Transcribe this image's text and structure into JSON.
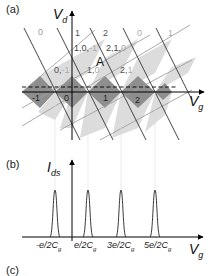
{
  "panel_a": {
    "label": "(a)",
    "y_axis_label": "V",
    "y_axis_sub": "d",
    "x_axis_label": "V",
    "x_axis_sub": "g",
    "point_label": "A",
    "top_labels": [
      "0",
      "1",
      "2",
      "0",
      "1"
    ],
    "top_label_colors": [
      "#999999",
      "#555555",
      "#555555",
      "#aaaaaa",
      "#aaaaaa"
    ],
    "row1_labels": [
      {
        "a": "1,0,",
        "b": "-1"
      },
      {
        "a": "2,1,",
        "b": "0"
      }
    ],
    "row2_labels": [
      {
        "a": "0,",
        "b": "-1"
      },
      {
        "a": "1,",
        "b": "0"
      },
      {
        "a": "2,",
        "b": "1"
      }
    ],
    "bottom_labels": [
      "-1",
      "0",
      "1",
      "2"
    ],
    "colors": {
      "dark_fill": "#8c8c8c",
      "light_fill": "#d9d9d9",
      "dark_line": "#333333",
      "gray_line": "#9a9a9a",
      "axis": "#000000"
    }
  },
  "panel_b": {
    "label": "(b)",
    "y_axis_label": "I",
    "y_axis_sub": "ds",
    "x_axis_label": "V",
    "x_axis_sub": "g",
    "tick_labels": [
      "-e/2C",
      "e/2C",
      "3e/2C",
      "5e/2C"
    ],
    "tick_sub": "g"
  },
  "panel_c": {
    "label": "(c)"
  }
}
